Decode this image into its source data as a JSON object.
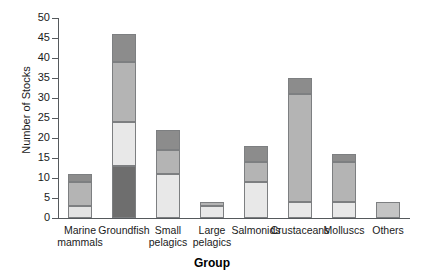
{
  "chart_data": {
    "type": "bar",
    "subtype": "stacked-bar",
    "title": "",
    "xlabel": "Group",
    "ylabel": "Number of Stocks",
    "ylim": [
      0,
      50
    ],
    "ytick_step": 5,
    "yticks": [
      0,
      5,
      10,
      15,
      20,
      25,
      30,
      35,
      40,
      45,
      50
    ],
    "grid": false,
    "legend": "none",
    "categories": [
      "Marine\nmammals",
      "Groundfish",
      "Small\npelagics",
      "Large\npelagics",
      "Salmonids",
      "Crustaceans",
      "Molluscs",
      "Others"
    ],
    "series": [
      {
        "name": "segment-1-light",
        "color": "#e3e3e3",
        "values": [
          3,
          0,
          11,
          3,
          9,
          4,
          4,
          0
        ]
      },
      {
        "name": "segment-2-mid",
        "color": "#b4b4b4",
        "values": [
          6,
          0,
          6,
          1,
          5,
          27,
          10,
          4
        ]
      },
      {
        "name": "segment-3-dark",
        "color": "#8c8c8c",
        "values": [
          2,
          0,
          5,
          0,
          4,
          4,
          2,
          0
        ]
      },
      {
        "name": "segment-4-darkest",
        "color": "#6e6e6e",
        "values": [
          0,
          13,
          0,
          0,
          0,
          0,
          0,
          0
        ]
      }
    ],
    "groundfish_stack": [
      {
        "name": "darkest",
        "color": "#6e6e6e",
        "from": 0,
        "to": 13
      },
      {
        "name": "light",
        "color": "#e8e8e8",
        "from": 13,
        "to": 24
      },
      {
        "name": "mid",
        "color": "#b4b4b4",
        "from": 24,
        "to": 39
      },
      {
        "name": "dark",
        "color": "#8c8c8c",
        "from": 39,
        "to": 46
      }
    ],
    "totals": [
      11,
      46,
      22,
      4,
      18,
      35,
      16,
      4
    ],
    "bars": [
      {
        "category": "Marine mammals",
        "total": 11,
        "segments": [
          {
            "from": 0,
            "to": 3,
            "color": "#e3e3e3"
          },
          {
            "from": 3,
            "to": 9,
            "color": "#b4b4b4"
          },
          {
            "from": 9,
            "to": 11,
            "color": "#8c8c8c"
          }
        ]
      },
      {
        "category": "Groundfish",
        "total": 46,
        "segments": [
          {
            "from": 0,
            "to": 13,
            "color": "#6e6e6e"
          },
          {
            "from": 13,
            "to": 24,
            "color": "#e8e8e8"
          },
          {
            "from": 24,
            "to": 39,
            "color": "#b4b4b4"
          },
          {
            "from": 39,
            "to": 46,
            "color": "#8c8c8c"
          }
        ]
      },
      {
        "category": "Small pelagics",
        "total": 22,
        "segments": [
          {
            "from": 0,
            "to": 11,
            "color": "#e8e8e8"
          },
          {
            "from": 11,
            "to": 17,
            "color": "#b4b4b4"
          },
          {
            "from": 17,
            "to": 22,
            "color": "#8c8c8c"
          }
        ]
      },
      {
        "category": "Large pelagics",
        "total": 4,
        "segments": [
          {
            "from": 0,
            "to": 3,
            "color": "#e8e8e8"
          },
          {
            "from": 3,
            "to": 4,
            "color": "#b4b4b4"
          }
        ]
      },
      {
        "category": "Salmonids",
        "total": 18,
        "segments": [
          {
            "from": 0,
            "to": 9,
            "color": "#e8e8e8"
          },
          {
            "from": 9,
            "to": 14,
            "color": "#b4b4b4"
          },
          {
            "from": 14,
            "to": 18,
            "color": "#8c8c8c"
          }
        ]
      },
      {
        "category": "Crustaceans",
        "total": 35,
        "segments": [
          {
            "from": 0,
            "to": 4,
            "color": "#e8e8e8"
          },
          {
            "from": 4,
            "to": 31,
            "color": "#b4b4b4"
          },
          {
            "from": 31,
            "to": 35,
            "color": "#8c8c8c"
          }
        ]
      },
      {
        "category": "Molluscs",
        "total": 16,
        "segments": [
          {
            "from": 0,
            "to": 4,
            "color": "#e8e8e8"
          },
          {
            "from": 4,
            "to": 14,
            "color": "#b4b4b4"
          },
          {
            "from": 14,
            "to": 16,
            "color": "#8c8c8c"
          }
        ]
      },
      {
        "category": "Others",
        "total": 4,
        "segments": [
          {
            "from": 0,
            "to": 4,
            "color": "#c4c4c4"
          }
        ]
      }
    ]
  },
  "axis": {
    "y_title": "Number of Stocks",
    "x_title": "Group",
    "y_tick_labels": [
      "0",
      "5",
      "10",
      "15",
      "20",
      "25",
      "30",
      "35",
      "40",
      "45",
      "50"
    ]
  },
  "colors": {
    "axis": "#55595c",
    "bar_outline": "#7d7f81",
    "text": "#1a1a1a",
    "background": "#ffffff"
  }
}
